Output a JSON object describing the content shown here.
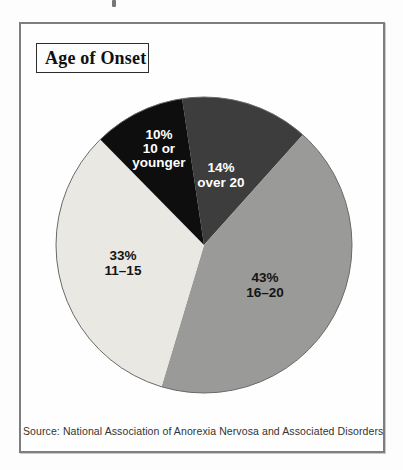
{
  "chart_data": {
    "type": "pie",
    "title": "Age of Onset",
    "source": "Source: National Association of Anorexia Nervosa and Associated Disorders",
    "start_angle_deg": -8.5,
    "legend": "none",
    "outline_color": "#6a6a6a",
    "slices": [
      {
        "label": "over 20",
        "pct_text": "14%",
        "value": 14,
        "color": "#3d3d3d",
        "text_color": "#ffffff"
      },
      {
        "label": "16–20",
        "pct_text": "43%",
        "value": 43,
        "color": "#9a9a98",
        "text_color": "#141414"
      },
      {
        "label": "11–15",
        "pct_text": "33%",
        "value": 33,
        "color": "#e9e8e3",
        "text_color": "#141414"
      },
      {
        "label": "10 or younger",
        "pct_text": "10%",
        "value": 10,
        "color": "#0e0e0e",
        "text_color": "#ffffff"
      }
    ]
  }
}
